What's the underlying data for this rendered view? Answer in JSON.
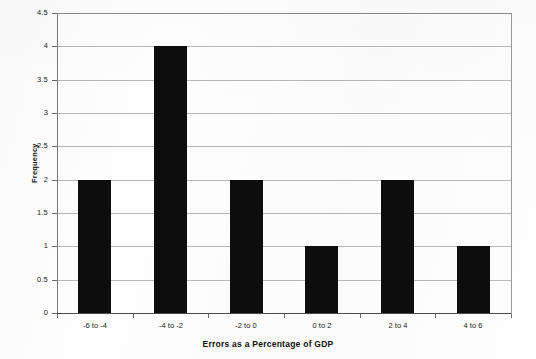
{
  "chart_data": {
    "type": "bar",
    "title": "",
    "subtitle": "",
    "xlabel": "Errors as a Percentage of GDP",
    "ylabel": "Frequency",
    "categories": [
      "-6 to -4",
      "-4 to -2",
      "-2 to 0",
      "0 to 2",
      "2 to 4",
      "4 to 6"
    ],
    "values": [
      2,
      4,
      2,
      1,
      2,
      1
    ],
    "series": [
      {
        "name": "Frequency",
        "values": [
          2,
          4,
          2,
          1,
          2,
          1
        ]
      }
    ],
    "ylim": [
      0,
      4.5
    ],
    "ytick_labels": [
      "0",
      "0.5",
      "1",
      "1.5",
      "2",
      "2.5",
      "3",
      "3.5",
      "4",
      "4.5"
    ],
    "ytick_values": [
      0,
      0.5,
      1,
      1.5,
      2,
      2.5,
      3,
      3.5,
      4,
      4.5
    ],
    "grid": "horizontal",
    "legend": "none",
    "bar_color": "#0d0d0d",
    "gridline_color": "#b8b8b8",
    "axis_color": "#4a4a4a",
    "background_color": "#fefefe",
    "annotations": []
  }
}
